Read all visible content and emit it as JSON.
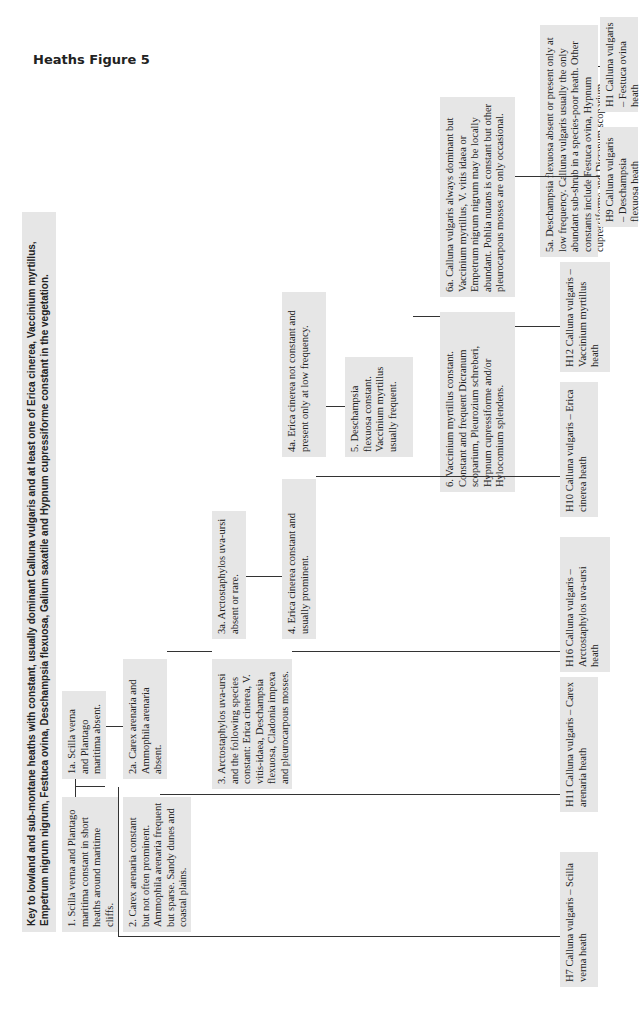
{
  "page": {
    "title": "Heaths Figure 5"
  },
  "caption": {
    "label": "Fig 5.",
    "text": "Key to lowland and sub-montane heaths with constant, usually dominant Calluna vulgaris and at least one of Erica cinerea, Vaccinium myrtillus, Empetrum nigrum nigrum, Festuca ovina, Deschampsia flexuosa, Galium saxatile and Hypnum cupressiforme constant in the vegetation."
  },
  "nodes": {
    "n1": "1. Scilla verna and Plantago maritima constant in short heaths around maritime cliffs.",
    "n1a": "1a. Scilla verna and Plantago maritima absent.",
    "n2": "2. Carex arenaria constant but not often prominent. Ammophila arenaria frequent but sparse. Sandy dunes and coastal plains.",
    "n2a": "2a. Carex arenaria and Ammophila arenaria absent.",
    "n3": "3. Arctostaphylos uva-ursi and the following species constant: Erica cinerea, V. vitis-idaea, Deschampsia flexuosa, Cladonia impexa and pleurocarpous mosses.",
    "n3a": "3a. Arctostaphylos uva-ursi absent or rare.",
    "n4": "4. Erica cinerea constant and usually prominent.",
    "n4a": "4a. Erica cinerea not constant and present only at low frequency.",
    "n5": "5. Deschampsia flexuosa constant. Vaccinium myrtillus usually frequent.",
    "n5a": "5a. Deschampsia flexuosa absent or present only at low frequency. Calluna vulgaris usually the only abundant sub-shrub in a species-poor heath. Other constants include Festuca ovina, Hypnum cupressiforme and Dicranum scoparium.",
    "n6": "6. Vaccinium myrtillus constant. Constant and frequent Dicranum scoparium, Pleurozium schreberi, Hypnum cupressiforme and/or Hylocomium splendens.",
    "n6a": "6a. Calluna vulgaris always dominant but Vaccinium myrtillus, V. vitis idaea or Empetrum nigrum nigrum may be locally abundant. Pohlia nutans is constant but other pleurocarpous mosses are only occasional."
  },
  "outcomes": {
    "H7": "H7 Calluna vulgaris – Scilla verna heath",
    "H11": "H11 Calluna vulgaris – Carex arenaria heath",
    "H16": "H16 Calluna vulgaris – Arctostaphylos uva-ursi heath",
    "H10": "H10 Calluna vulgaris – Erica cinerea heath",
    "H12": "H12 Calluna vulgaris – Vaccinium myrtillus heath",
    "H9": "H9 Calluna vulgaris – Deschampsia flexuosa heath",
    "H1": "H1 Calluna vulgaris – Festuca ovina heath"
  }
}
